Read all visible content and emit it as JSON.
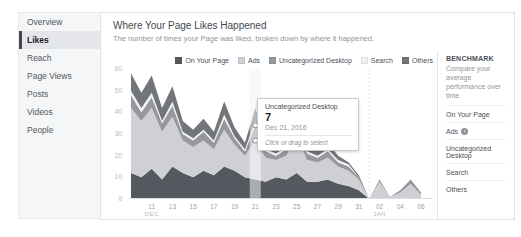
{
  "sidebar": {
    "items": [
      {
        "label": "Overview"
      },
      {
        "label": "Likes"
      },
      {
        "label": "Reach"
      },
      {
        "label": "Page Views"
      },
      {
        "label": "Posts"
      },
      {
        "label": "Videos"
      },
      {
        "label": "People"
      }
    ]
  },
  "header": {
    "title": "Where Your Page Likes Happened",
    "subtitle": "The number of times your Page was liked, broken down by where it happened."
  },
  "tooltip": {
    "series": "Uncategorized Desktop",
    "value": "7",
    "date": "Dec 21, 2016",
    "hint": "Click or drag to select"
  },
  "benchmark": {
    "heading": "BENCHMARK",
    "description": "Compare your average performance over time.",
    "items": [
      {
        "label": "On Your Page",
        "has_info": false
      },
      {
        "label": "Ads",
        "has_info": true
      },
      {
        "label": "Uncategorized Desktop",
        "has_info": false
      },
      {
        "label": "Search",
        "has_info": false
      },
      {
        "label": "Others",
        "has_info": false
      }
    ]
  },
  "chart_data": {
    "type": "area",
    "stacked": true,
    "title": "Where Your Page Likes Happened",
    "ylabel": "",
    "xlabel": "",
    "ylim": [
      0,
      60
    ],
    "y_ticks": [
      60,
      50,
      40,
      30,
      20,
      10,
      0
    ],
    "x": [
      "Dec 9",
      "Dec 10",
      "Dec 11",
      "Dec 12",
      "Dec 13",
      "Dec 14",
      "Dec 15",
      "Dec 16",
      "Dec 17",
      "Dec 18",
      "Dec 19",
      "Dec 20",
      "Dec 21",
      "Dec 22",
      "Dec 23",
      "Dec 24",
      "Dec 25",
      "Dec 26",
      "Dec 27",
      "Dec 28",
      "Dec 29",
      "Dec 30",
      "Dec 31",
      "Jan 1",
      "Jan 2",
      "Jan 3",
      "Jan 4",
      "Jan 5",
      "Jan 6"
    ],
    "series": [
      {
        "name": "On Your Page",
        "color": "#55585e",
        "values": [
          12,
          10,
          14,
          9,
          15,
          12,
          10,
          13,
          11,
          15,
          13,
          10,
          9,
          8,
          10,
          9,
          12,
          8,
          8,
          9,
          7,
          6,
          4,
          0,
          0,
          0,
          0,
          0,
          0
        ]
      },
      {
        "name": "Ads",
        "color": "#ced0d4",
        "values": [
          30,
          26,
          28,
          22,
          23,
          15,
          14,
          14,
          12,
          17,
          12,
          10,
          18,
          11,
          8,
          11,
          17,
          10,
          9,
          10,
          8,
          7,
          5,
          0,
          8,
          1,
          3,
          7,
          2
        ]
      },
      {
        "name": "Uncategorized Desktop",
        "color": "#96989d",
        "values": [
          6,
          4,
          5,
          4,
          5,
          3,
          3,
          4,
          3,
          5,
          3,
          2,
          7,
          3,
          2,
          3,
          5,
          3,
          2,
          3,
          2,
          2,
          1,
          0,
          1,
          0,
          1,
          2,
          1
        ]
      },
      {
        "name": "Search",
        "color": "#f1f2f4",
        "values": [
          2,
          2,
          2,
          1,
          2,
          1,
          1,
          1,
          1,
          2,
          1,
          1,
          2,
          1,
          1,
          1,
          2,
          1,
          1,
          1,
          1,
          1,
          0,
          0,
          0,
          0,
          0,
          0,
          0
        ]
      },
      {
        "name": "Others",
        "color": "#72757a",
        "values": [
          8,
          7,
          8,
          6,
          7,
          5,
          4,
          5,
          4,
          6,
          4,
          3,
          6,
          3,
          2,
          3,
          5,
          3,
          2,
          3,
          2,
          1,
          1,
          0,
          0,
          0,
          0,
          0,
          0
        ]
      }
    ],
    "x_ticks": [
      {
        "index": 2,
        "label": "11"
      },
      {
        "index": 4,
        "label": "13"
      },
      {
        "index": 6,
        "label": "15"
      },
      {
        "index": 8,
        "label": "17"
      },
      {
        "index": 10,
        "label": "19"
      },
      {
        "index": 12,
        "label": "21"
      },
      {
        "index": 14,
        "label": "23"
      },
      {
        "index": 16,
        "label": "25"
      },
      {
        "index": 18,
        "label": "27"
      },
      {
        "index": 20,
        "label": "29"
      },
      {
        "index": 22,
        "label": "31"
      },
      {
        "index": 24,
        "label": "02"
      },
      {
        "index": 26,
        "label": "04"
      },
      {
        "index": 28,
        "label": "06"
      }
    ],
    "month_labels": [
      {
        "index": 2,
        "label": "DEC"
      },
      {
        "index": 24,
        "label": "JAN"
      }
    ],
    "month_separator_index": 23,
    "legend_position": "top",
    "grid": false,
    "hover": {
      "index": 12,
      "series": "Uncategorized Desktop",
      "value": 7,
      "date": "Dec 21, 2016"
    }
  }
}
